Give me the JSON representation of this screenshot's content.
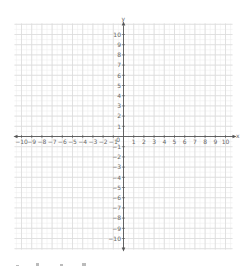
{
  "chart_data": {
    "type": "coordinate-plane",
    "title": "",
    "xlabel": "x",
    "ylabel": "y",
    "xlim": [
      -10,
      10
    ],
    "ylim": [
      -10,
      10
    ],
    "x_ticks": [
      -10,
      -9,
      -8,
      -7,
      -6,
      -5,
      -4,
      -3,
      -2,
      -1,
      1,
      2,
      3,
      4,
      5,
      6,
      7,
      8,
      9,
      10
    ],
    "y_ticks": [
      -10,
      -9,
      -8,
      -7,
      -6,
      -5,
      -4,
      -3,
      -2,
      -1,
      1,
      2,
      3,
      4,
      5,
      6,
      7,
      8,
      9,
      10
    ],
    "origin_label": "0",
    "grid": true,
    "minor_grid": true,
    "points": [],
    "series": []
  },
  "colors": {
    "grid_major": "#dcdcdc",
    "grid_minor": "#efefef",
    "axis": "#555555",
    "label": "#666666",
    "footer_marks": "#bbbbbb"
  }
}
